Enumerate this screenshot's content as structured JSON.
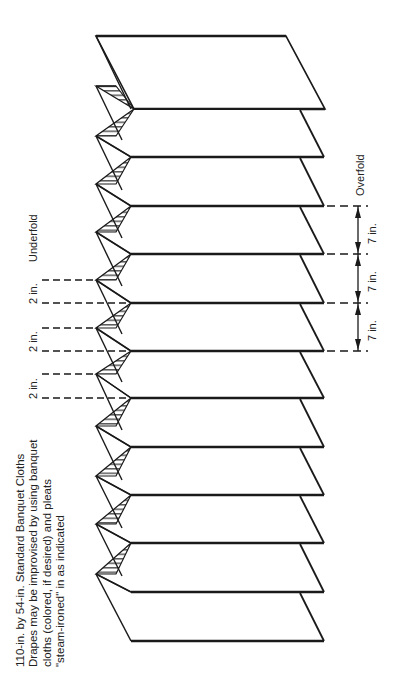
{
  "caption": {
    "lines": [
      "110-in. by 54-in. Standard Banquet Cloths",
      "Drapes may be improvised by using banquet",
      "cloths (colored, if desired) and pleats",
      "\"steam-ironed\" in as indicated"
    ]
  },
  "labels": {
    "underfold": "Underfold",
    "overfold": "Overfold",
    "pleat_depth": [
      "2 in.",
      "2 in.",
      "2 in."
    ],
    "pleat_spacing": [
      "7 in.",
      "7 in.",
      "7 in."
    ]
  },
  "diagram": {
    "panel_count": 12,
    "pleat_count": 11,
    "line_color": "#1a1a1a",
    "background": "#ffffff"
  }
}
